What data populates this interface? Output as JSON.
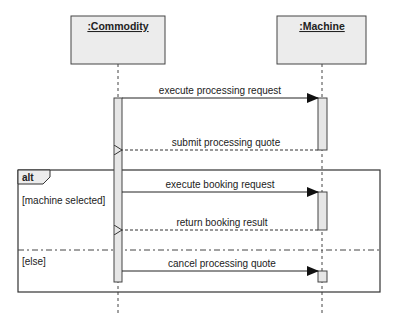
{
  "diagram": {
    "type": "uml-sequence",
    "colors": {
      "line": "#333333",
      "box_fill": "#ececec",
      "activation_fill": "#e6e6e6",
      "text": "#222222"
    },
    "lifelines": [
      {
        "id": "commodity",
        "label": ":Commodity"
      },
      {
        "id": "machine",
        "label": ":Machine"
      }
    ],
    "messages": [
      {
        "label": "execute processing request",
        "from": "commodity",
        "to": "machine",
        "kind": "sync"
      },
      {
        "label": "submit processing quote",
        "from": "machine",
        "to": "commodity",
        "kind": "reply"
      },
      {
        "label": "execute booking request",
        "from": "commodity",
        "to": "machine",
        "kind": "sync"
      },
      {
        "label": "return booking result",
        "from": "machine",
        "to": "commodity",
        "kind": "reply"
      },
      {
        "label": "cancel processing quote",
        "from": "commodity",
        "to": "machine",
        "kind": "sync"
      }
    ],
    "fragment": {
      "operator": "alt",
      "operands": [
        {
          "guard": "[machine selected]"
        },
        {
          "guard": "[else]"
        }
      ]
    }
  }
}
